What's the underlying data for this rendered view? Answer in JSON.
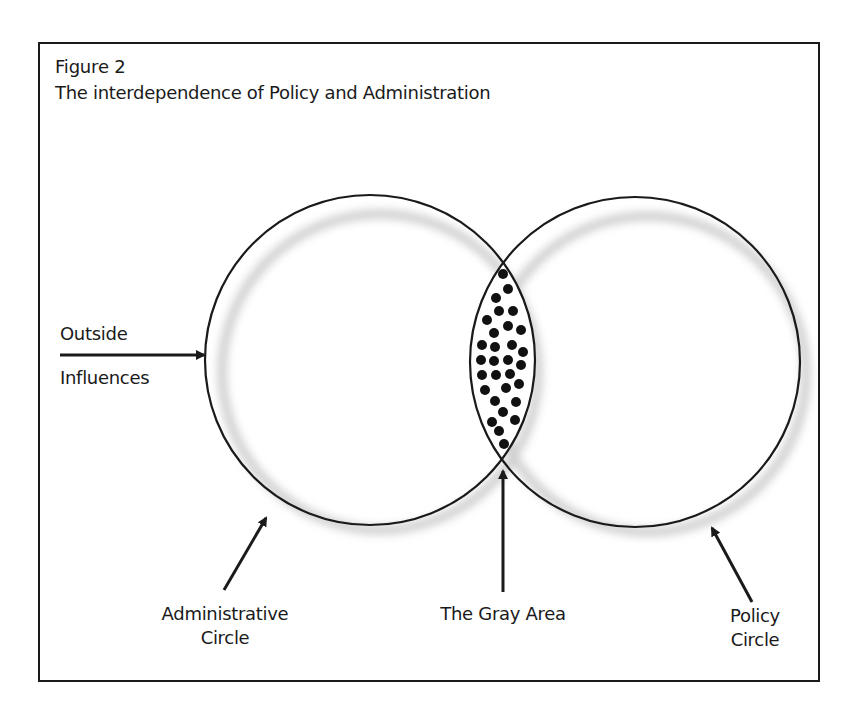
{
  "figure": {
    "number_label": "Figure 2",
    "title": "The interdependence of Policy and Administration"
  },
  "diagram": {
    "type": "venn",
    "circles": [
      {
        "id": "administrative",
        "label_line1": "Administrative",
        "label_line2": "Circle",
        "cx": 370,
        "cy": 360,
        "r": 165
      },
      {
        "id": "policy",
        "label_line1": "Policy",
        "label_line2": "Circle",
        "cx": 635,
        "cy": 362,
        "r": 165
      }
    ],
    "overlap": {
      "label": "The Gray Area",
      "fill_pattern": "black-dots"
    },
    "external_input": {
      "label_line1": "Outside",
      "label_line2": "Influences"
    },
    "colors": {
      "stroke": "#1a1a1a",
      "halo": "#c8c8c8",
      "dot": "#111111",
      "background": "#ffffff"
    }
  }
}
